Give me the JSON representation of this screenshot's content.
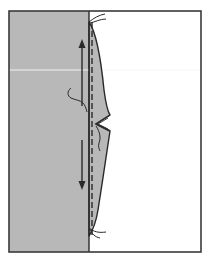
{
  "diagram": {
    "colors": {
      "background": "#ffffff",
      "frame": "#3a3a3a",
      "fabric_fill": "#b8b8b8",
      "line": "#2a2a2a",
      "highlight_line": "#f2f2f2"
    },
    "elements": {
      "frame": "outer-frame",
      "fabric_panel": "gray-fabric-panel",
      "fold_line": "solid-fold-line",
      "stitch_line": "dashed-stitch-line",
      "flap": "curved-fabric-flap",
      "notch": "v-notch",
      "arrow_up": "up-arrow",
      "arrow_down": "down-arrow",
      "thread_top": "thread-ends-top",
      "thread_bottom": "thread-ends-bottom",
      "thread_mid_left": "loose-thread-left",
      "thread_mid_notch": "loose-thread-notch",
      "guide_line": "white-horizontal-line"
    }
  }
}
